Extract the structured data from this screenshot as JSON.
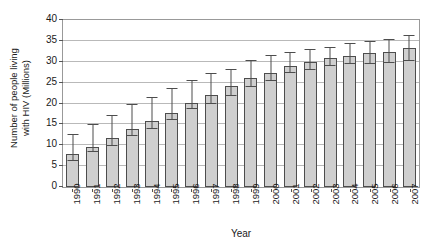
{
  "chart_data": {
    "type": "bar",
    "title": "",
    "xlabel": "Year",
    "ylabel": "Number of people living with HIV (Millions)",
    "ylabel_line1": "Number of people living",
    "ylabel_line2": "with HIV (Millions)",
    "ylim": [
      0,
      40
    ],
    "yticks": [
      40,
      35,
      30,
      25,
      20,
      15,
      10,
      5,
      0
    ],
    "grid": true,
    "legend": "none",
    "error_bars": true,
    "bar_color": "#cfcfcf",
    "bar_edge_color": "#4d4d4d",
    "gridline_color": "#b9b9b9",
    "categories": [
      "1990",
      "1991",
      "1992",
      "1993",
      "1994",
      "1995",
      "1996",
      "1997",
      "1998",
      "1999",
      "2000",
      "2001",
      "2002",
      "2003",
      "2004",
      "2005",
      "2006",
      "2007"
    ],
    "values": [
      7.9,
      9.7,
      11.7,
      13.8,
      15.7,
      17.8,
      20.1,
      22.1,
      24.1,
      26.1,
      27.4,
      28.9,
      30.0,
      30.9,
      31.5,
      32.0,
      32.4,
      33.2
    ],
    "error_low": [
      6.2,
      8.4,
      9.9,
      12.1,
      14.0,
      16.1,
      18.6,
      19.9,
      21.9,
      23.9,
      25.5,
      27.2,
      28.1,
      28.9,
      29.4,
      29.4,
      29.8,
      30.3
    ],
    "error_high": [
      12.5,
      14.9,
      17.0,
      19.6,
      21.4,
      23.4,
      25.3,
      27.0,
      28.0,
      30.1,
      31.5,
      32.2,
      32.7,
      33.4,
      34.3,
      34.8,
      35.2,
      36.2
    ]
  }
}
